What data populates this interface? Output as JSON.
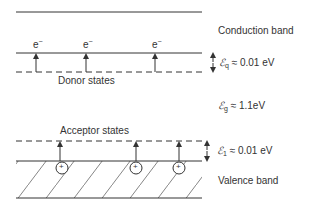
{
  "labels": {
    "conduction_band": "Conduction band",
    "valence_band": "Valence band",
    "donor_states": "Donor states",
    "acceptor_states": "Acceptor states",
    "electron": "e",
    "electron_charge": "−",
    "hole_symbol": "+"
  },
  "energies": {
    "donor": {
      "symbol": "ℰ",
      "subscript": "q",
      "text": " ≈ 0.01 eV"
    },
    "gap": {
      "symbol": "ℰ",
      "subscript": "g",
      "text": " ≈ 1.1eV"
    },
    "acceptor": {
      "symbol": "ℰ",
      "subscript": "1",
      "text": " ≈ 0.01 eV"
    }
  },
  "electrons_count": 3,
  "holes_count": 3
}
